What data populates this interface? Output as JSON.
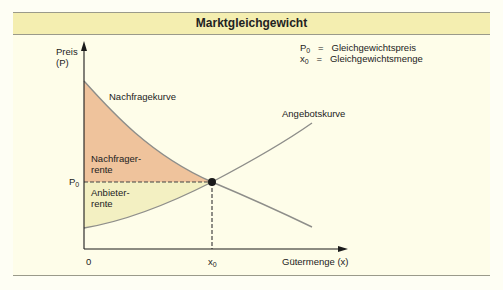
{
  "title": "Marktgleichgewicht",
  "legend": [
    {
      "symbol": "P",
      "sub": "0",
      "eq": "=",
      "text": "Gleichgewichtspreis"
    },
    {
      "symbol": "x",
      "sub": "0",
      "eq": "=",
      "text": "Gleichgewichtsmenge"
    }
  ],
  "axes": {
    "y_label_line1": "Preis",
    "y_label_line2": "(P)",
    "x_label": "Gütermenge (x)",
    "origin": "0",
    "x0_symbol": "x",
    "x0_sub": "0",
    "p0_symbol": "P",
    "p0_sub": "0"
  },
  "curves": {
    "demand": "Nachfragekurve",
    "supply": "Angebotskurve"
  },
  "areas": {
    "consumer_line1": "Nachfrager-",
    "consumer_line2": "rente",
    "producer_line1": "Anbieter-",
    "producer_line2": "rente"
  },
  "colors": {
    "header_bg": "#f4eeb0",
    "panel_bg": "#fefde9",
    "consumer_surplus": "#efc39c",
    "producer_surplus": "#f3f0c2",
    "curve": "#8e8e8a",
    "axis": "#1a1a1a"
  }
}
